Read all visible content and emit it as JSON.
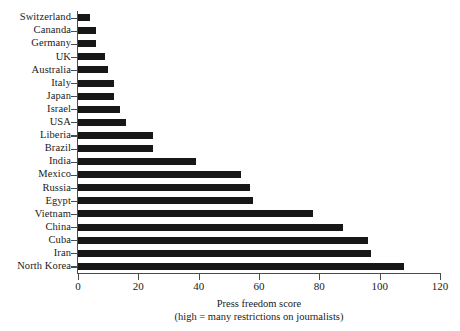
{
  "chart_data": {
    "type": "bar",
    "orientation": "horizontal",
    "title": "",
    "xlabel": "Press freedom score",
    "xlabel_note": "(high = many restrictions on journalists)",
    "ylabel": "",
    "xlim": [
      0,
      120
    ],
    "xticks": [
      0,
      20,
      40,
      60,
      80,
      100,
      120
    ],
    "xtick_labels": [
      "0",
      "20",
      "40",
      "60",
      "80",
      "100",
      "120"
    ],
    "grid": false,
    "legend": false,
    "bar_color": "#171717",
    "axis_color": "#4a4a4a",
    "categories": [
      "Switzerland",
      "Cananda",
      "Germany",
      "UK",
      "Australia",
      "Italy",
      "Japan",
      "Israel",
      "USA",
      "Liberia",
      "Brazil",
      "India",
      "Mexico",
      "Russia",
      "Egypt",
      "Vietnam",
      "China",
      "Cuba",
      "Iran",
      "North Korea"
    ],
    "values": [
      4,
      6,
      6,
      9,
      10,
      12,
      12,
      14,
      16,
      25,
      25,
      39,
      54,
      57,
      58,
      78,
      88,
      96,
      97,
      108
    ]
  }
}
